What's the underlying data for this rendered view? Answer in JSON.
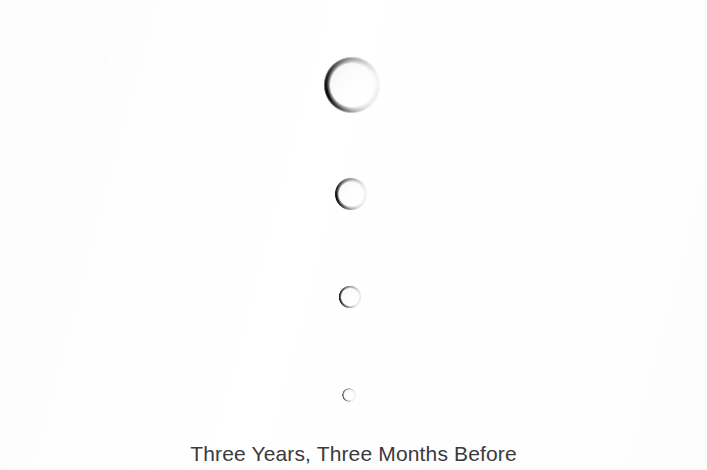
{
  "artwork": {
    "background_color": "#fdfdfd",
    "caption": {
      "text": "Three Years, Three Months Before",
      "color": "#3a3a3c",
      "center_x": 354,
      "baseline_y": 463,
      "font_size_px": 21
    },
    "droplets": [
      {
        "name": "droplet-1-largest",
        "center_x": 352,
        "center_y": 85,
        "diameter": 57,
        "ring_thickness_px": 7,
        "shade": "dark arc upper-left and left, fading to near-white at lower-right",
        "darkest_color": "#0a0a0c",
        "lightest_color": "#eeeef1"
      },
      {
        "name": "droplet-2",
        "center_x": 351,
        "center_y": 194,
        "diameter": 33,
        "ring_thickness_px": 4.5,
        "shade": "dark arc upper-left and left, fading to near-white at lower-right",
        "darkest_color": "#101012",
        "lightest_color": "#e9e9ec"
      },
      {
        "name": "droplet-3",
        "center_x": 350,
        "center_y": 297,
        "diameter": 23,
        "ring_thickness_px": 3,
        "shade": "dark ring, darkest upper-left, lighter lower-right",
        "darkest_color": "#17171a",
        "lightest_color": "#d9d9dd"
      },
      {
        "name": "droplet-4-smallest",
        "center_x": 349,
        "center_y": 395,
        "diameter": 14,
        "ring_thickness_px": 2,
        "shade": "thin gray ring, open/faded at lower-right",
        "darkest_color": "#4a4a4f",
        "lightest_color": "#e4e4e8"
      }
    ]
  }
}
